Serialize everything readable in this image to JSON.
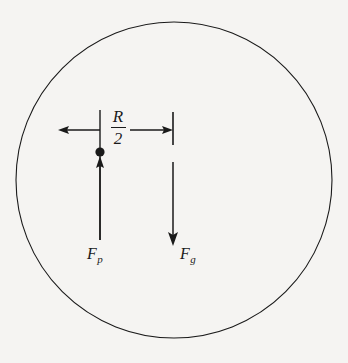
{
  "figure": {
    "name": "gravity-pressure-force-diagram",
    "background_color": "#f5f4f2",
    "ink_color": "#1a1a1a"
  },
  "circle": {
    "name": "body-outline",
    "center_x": 174,
    "center_y": 180,
    "radius": 158,
    "stroke_width": 1.1
  },
  "distance_marker": {
    "label_numerator": "R",
    "label_denominator": "2",
    "label_plain": "R/2",
    "y": 130,
    "left_arrow": {
      "from_x": 100,
      "to_x": 60
    },
    "right_arrow": {
      "from_x": 130,
      "to_x": 173
    }
  },
  "reference_lines": [
    {
      "name": "center-vertical-line",
      "x": 100,
      "y_top": 110,
      "y_bottom": 240
    },
    {
      "name": "edge-tick-line",
      "x": 173,
      "y_top": 112,
      "y_bottom": 145
    }
  ],
  "point_mass": {
    "name": "mass-point",
    "x": 100,
    "y": 152,
    "radius": 4.6
  },
  "vectors": [
    {
      "name": "pressure-force-vector",
      "label_base": "F",
      "label_sub": "p",
      "direction": "up",
      "x": 100,
      "tail_y": 240,
      "head_y": 157
    },
    {
      "name": "gravity-force-vector",
      "label_base": "F",
      "label_sub": "g",
      "direction": "down",
      "x": 173,
      "tail_y": 162,
      "head_y": 245
    }
  ]
}
